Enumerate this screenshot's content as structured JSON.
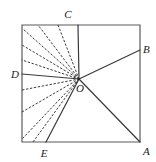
{
  "figure": {
    "background": "#ffffff",
    "stroke_color": "#3a3a3a",
    "label_color": "#1a1a1a",
    "square": {
      "top_left": {
        "x": 22,
        "y": 25
      },
      "top_right": {
        "x": 140,
        "y": 25
      },
      "bottom_right": {
        "x": 140,
        "y": 142
      },
      "bottom_left": {
        "x": 22,
        "y": 142
      }
    },
    "center_point": {
      "name": "O",
      "x": 79,
      "y": 79
    },
    "vertices": [
      {
        "name": "A",
        "x": 140,
        "y": 142,
        "label_x": 143,
        "label_y": 155
      },
      {
        "name": "B",
        "x": 140,
        "y": 50,
        "label_x": 143,
        "label_y": 52
      },
      {
        "name": "C",
        "x": 78,
        "y": 25,
        "label_x": 68,
        "label_y": 17
      },
      {
        "name": "D",
        "x": 22,
        "y": 74,
        "label_x": 9,
        "label_y": 77
      },
      {
        "name": "E",
        "x": 46,
        "y": 142,
        "label_x": 41,
        "label_y": 156
      },
      {
        "name": "O",
        "x": 79,
        "y": 79,
        "label_x": 79,
        "label_y": 92
      }
    ],
    "solid_rays": [
      {
        "name": "ray-O-A",
        "to": "A",
        "x2": 140,
        "y2": 142
      },
      {
        "name": "ray-O-B",
        "to": "B",
        "x2": 140,
        "y2": 50
      },
      {
        "name": "ray-O-C",
        "to": "C",
        "x2": 78,
        "y2": 25
      },
      {
        "name": "ray-O-D",
        "to": "D",
        "x2": 22,
        "y2": 74
      },
      {
        "name": "ray-O-E",
        "to": "E",
        "x2": 46,
        "y2": 142
      }
    ],
    "dashed_rays_upper": [
      {
        "name": "dashed-ray-upper-1",
        "x2": 58,
        "y2": 25
      },
      {
        "name": "dashed-ray-upper-2",
        "x2": 38,
        "y2": 25
      },
      {
        "name": "dashed-ray-upper-3",
        "x2": 23,
        "y2": 29
      },
      {
        "name": "dashed-ray-upper-4",
        "x2": 22,
        "y2": 45
      },
      {
        "name": "dashed-ray-upper-5",
        "x2": 22,
        "y2": 60
      }
    ],
    "dashed_rays_lower": [
      {
        "name": "dashed-ray-lower-1",
        "x2": 22,
        "y2": 90
      },
      {
        "name": "dashed-ray-lower-2",
        "x2": 22,
        "y2": 112
      },
      {
        "name": "dashed-ray-lower-3",
        "x2": 23,
        "y2": 138
      },
      {
        "name": "dashed-ray-lower-4",
        "x2": 33,
        "y2": 142
      }
    ],
    "labels": {
      "a": "A",
      "b": "B",
      "c": "C",
      "d": "D",
      "e": "E",
      "o": "O"
    }
  }
}
